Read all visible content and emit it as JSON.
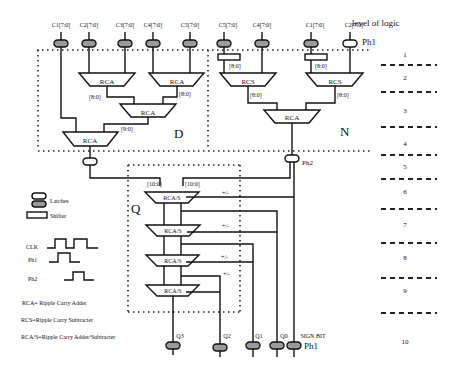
{
  "diagram": {
    "level_header": "level of logic",
    "levels": [
      "1",
      "2",
      "3",
      "4",
      "5",
      "6",
      "7",
      "8",
      "9",
      "10"
    ],
    "inputs_d": [
      "C1[7:0]",
      "C2[7:0]",
      "C3[7:0]",
      "C4[7:0]",
      "C5[7:0]"
    ],
    "inputs_n": [
      "C5[7:0]",
      "C4[7:0]",
      "C1[7:0]",
      "C2[7:0]"
    ],
    "ph1_top": "Ph1",
    "ph2": "Ph2",
    "ph1_bottom": "Ph1",
    "block_labels": {
      "rca": "RCA",
      "rcs": "RCS",
      "rcas": "RCA/S"
    },
    "bus_labels": {
      "b8": "[8:0]",
      "b9": "[9:0]",
      "b10": "[10:0]",
      "pm": "+/-"
    },
    "regions": {
      "d": "D",
      "n": "N",
      "q": "Q"
    },
    "outputs": [
      "Q3",
      "Q2",
      "Q1",
      "Q0",
      "SIGN BIT"
    ],
    "legend": {
      "latches": "Latches",
      "shifter": "Shifter",
      "clk": "CLK",
      "ph1": "Ph1",
      "ph2": "Ph2",
      "def_rca": "RCA= Ripple Carry Adder",
      "def_rcs": "RCS=Ripple Carry  Subtracter",
      "def_rcas": "RCA/S=Ripple Carry Adder/Subtracter"
    }
  }
}
